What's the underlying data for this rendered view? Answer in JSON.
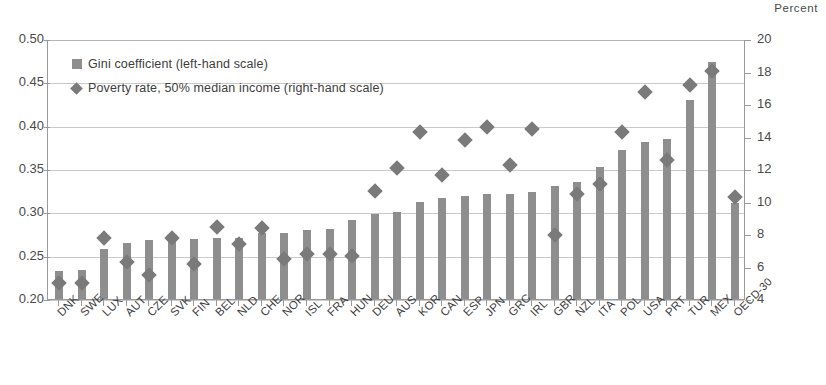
{
  "axes": {
    "right_axis_title": "Percent",
    "left_ticks": [
      "0.50",
      "0.45",
      "0.40",
      "0.35",
      "0.30",
      "0.25",
      "0.20"
    ],
    "right_ticks": [
      "20",
      "18",
      "16",
      "14",
      "12",
      "10",
      "8",
      "6",
      "4"
    ]
  },
  "legend": {
    "items": [
      {
        "label": "Gini coefficient (left-hand scale)",
        "marker": "square-swatch",
        "color": "#8e8e8e"
      },
      {
        "label": "Poverty rate, 50% median income (right-hand scale)",
        "marker": "diamond-swatch",
        "color": "#7a7a7a"
      }
    ]
  },
  "chart_data": {
    "type": "bar",
    "title": "",
    "xlabel": "",
    "ylabel": "",
    "y2label": "Percent",
    "ylim": [
      0.2,
      0.5
    ],
    "y2lim": [
      4,
      20
    ],
    "grid": true,
    "legend_position": "top-left",
    "categories": [
      "DNK",
      "SWE",
      "LUX",
      "AUT",
      "CZE",
      "SVK",
      "FIN",
      "BEL",
      "NLD",
      "CHE",
      "NOR",
      "ISL",
      "FRA",
      "HUN",
      "DEU",
      "AUS",
      "KOR",
      "CAN",
      "ESP",
      "JPN",
      "GRC",
      "IRL",
      "GBR",
      "NZL",
      "ITA",
      "POL",
      "USA",
      "PRT",
      "TUR",
      "MEX",
      "OECD-30"
    ],
    "series": [
      {
        "name": "Gini coefficient (left-hand scale)",
        "axis": "left",
        "type": "bar",
        "color": "#8e8e8e",
        "values": [
          0.232,
          0.234,
          0.258,
          0.265,
          0.268,
          0.268,
          0.269,
          0.271,
          0.271,
          0.276,
          0.276,
          0.28,
          0.281,
          0.291,
          0.298,
          0.301,
          0.312,
          0.317,
          0.319,
          0.321,
          0.321,
          0.323,
          0.331,
          0.335,
          0.352,
          0.372,
          0.381,
          0.385,
          0.43,
          0.474,
          0.311
        ]
      },
      {
        "name": "Poverty rate, 50% median income (right-hand scale)",
        "axis": "right",
        "type": "scatter",
        "marker": "diamond",
        "color": "#7a7a7a",
        "values": [
          5.3,
          5.3,
          8.1,
          6.6,
          5.8,
          8.1,
          6.5,
          8.8,
          7.7,
          8.7,
          6.8,
          7.1,
          7.1,
          7.0,
          11.0,
          12.4,
          14.6,
          12.0,
          14.1,
          14.9,
          12.6,
          14.8,
          8.3,
          10.8,
          11.4,
          14.6,
          17.1,
          12.9,
          17.5,
          18.4,
          10.6
        ]
      }
    ]
  }
}
